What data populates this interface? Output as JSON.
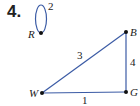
{
  "problem_number": "4.",
  "graph": {
    "edge_color": "#3b5ba5",
    "vertices": [
      {
        "id": "R",
        "label": "R"
      },
      {
        "id": "B",
        "label": "B"
      },
      {
        "id": "W",
        "label": "W"
      },
      {
        "id": "G",
        "label": "G"
      }
    ],
    "edges": [
      {
        "from": "R",
        "to": "R",
        "weight": "2",
        "type": "loop"
      },
      {
        "from": "W",
        "to": "B",
        "weight": "3"
      },
      {
        "from": "B",
        "to": "G",
        "weight": "4"
      },
      {
        "from": "W",
        "to": "G",
        "weight": "1"
      }
    ]
  }
}
